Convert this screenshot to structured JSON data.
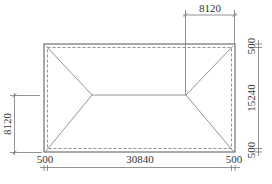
{
  "drawing": {
    "type": "hip-roof-plan",
    "dimensions": {
      "top_hip_run": "8120",
      "left_hip_run": "8120",
      "right_top_overhang": "500",
      "right_width": "15240",
      "right_bottom_overhang": "500",
      "bottom_left_overhang": "500",
      "bottom_length": "30840",
      "bottom_right_overhang": "500"
    }
  }
}
